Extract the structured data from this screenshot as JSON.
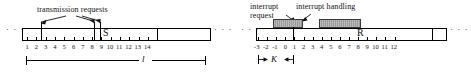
{
  "figure": {
    "type": "timeline-diagram-pair",
    "background": "#ffffff",
    "ink": "#000000",
    "block_fill": "#9b9b9b"
  },
  "left": {
    "caption": "transmission requests",
    "marker_letter": "S",
    "interval_label": "l",
    "ellipsis_left": "· · ·",
    "ellipsis_right": "· · ·",
    "tick_labels": [
      "1",
      "2",
      "3",
      "4",
      "5",
      "6",
      "7",
      "8",
      "9",
      "10",
      "11",
      "12",
      "13",
      "14"
    ],
    "arrow_targets": [
      2,
      7,
      8
    ],
    "request_lines": [
      2,
      7,
      8
    ],
    "interval_from": 1,
    "interval_to": 14,
    "frame_end_tick": 14
  },
  "right": {
    "caption_request_line1": "interrupt",
    "caption_request_line2": "request",
    "caption_handling": "interrupt handling",
    "marker_letter": "R",
    "interval_label": "K",
    "ellipsis_left": "· · ·",
    "ellipsis_right": "· · ·",
    "tick_labels": [
      "-3",
      "-2",
      "-1",
      "0",
      "1",
      "2",
      "3",
      "4",
      "5",
      "6",
      "7",
      "8",
      "9",
      "10",
      "11",
      "12"
    ],
    "handling_blocks": [
      {
        "start": -1,
        "end": 2
      },
      {
        "start": 4,
        "end": 8
      }
    ],
    "request_line": 1,
    "interval_from": -3,
    "interval_to": 1,
    "frame_end_tick": 12
  }
}
